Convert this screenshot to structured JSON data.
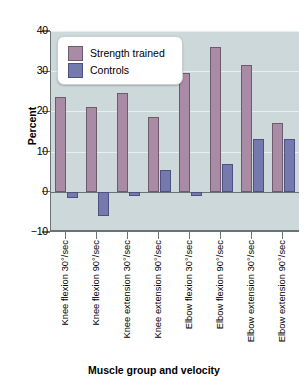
{
  "chart_data": {
    "type": "bar",
    "title": "",
    "xlabel": "Muscle group and velocity",
    "ylabel": "Percent",
    "ylim": [
      -10,
      40
    ],
    "yticks": [
      40,
      30,
      20,
      10,
      0,
      -10
    ],
    "ytick_labels": [
      "40",
      "30",
      "20",
      "10",
      "0",
      "−10"
    ],
    "grid": true,
    "legend_position": "upper-left-inside",
    "categories": [
      "Knee flexion 30°/sec",
      "Knee flexion 90°/sec",
      "Knee extension 30°/sec",
      "Knee extension 90°/sec",
      "Elbow flexion 30°/sec",
      "Elbow flexion 90°/sec",
      "Elbow extension 30°/sec",
      "Elbow extension 90°/sec"
    ],
    "series": [
      {
        "name": "Strength trained",
        "color": "#a98ba5",
        "values": [
          23.5,
          21.0,
          24.6,
          18.5,
          29.5,
          36.0,
          31.5,
          17.2
        ]
      },
      {
        "name": "Controls",
        "color": "#7479ae",
        "values": [
          -1.5,
          -6.0,
          -1.0,
          5.4,
          -1.0,
          7.0,
          13.2,
          13.2
        ]
      }
    ]
  },
  "axes": {
    "y_title": "Percent",
    "x_title": "Muscle group and velocity"
  },
  "legend": {
    "entries": [
      {
        "label": "Strength trained",
        "swatch": "strength-trained-swatch"
      },
      {
        "label": "Controls",
        "swatch": "controls-swatch"
      }
    ]
  },
  "colors": {
    "strength_trained": "#a98ba5",
    "controls": "#7479ae",
    "plot_background": "#ccd8da",
    "axis": "#6b7274",
    "gridline": "#e8eff0",
    "legend_background": "#ffffff"
  }
}
